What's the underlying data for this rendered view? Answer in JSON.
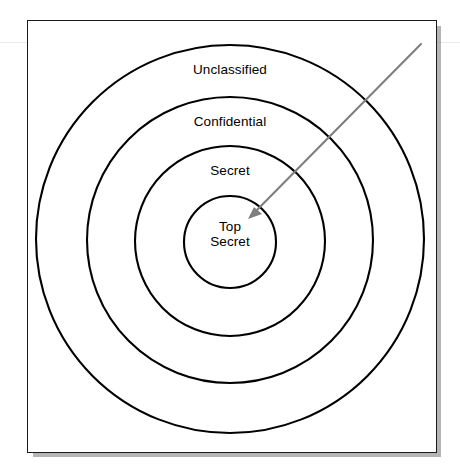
{
  "diagram": {
    "type": "concentric-rings",
    "background_color": "#ffffff",
    "frame": {
      "border_color": "#1a1a1a",
      "shadow_color": "#787878"
    },
    "rings": [
      {
        "index": 0,
        "label": "Unclassified",
        "level": 4,
        "stroke_color": "#000000",
        "fill_color": "#ffffff",
        "center": {
          "x": 230,
          "y": 239
        },
        "radius": 194
      },
      {
        "index": 1,
        "label": "Confidential",
        "level": 3,
        "stroke_color": "#000000",
        "fill_color": "#ffffff",
        "center": {
          "x": 230,
          "y": 240
        },
        "radius": 143
      },
      {
        "index": 2,
        "label": "Secret",
        "level": 2,
        "stroke_color": "#000000",
        "fill_color": "#ffffff",
        "center": {
          "x": 230,
          "y": 241
        },
        "radius": 95
      },
      {
        "index": 3,
        "label": "Top\nSecret",
        "label_line1": "Top",
        "label_line2": "Secret",
        "level": 1,
        "stroke_color": "#000000",
        "fill_color": "#ffffff",
        "center": {
          "x": 230,
          "y": 242
        },
        "radius": 46
      }
    ],
    "annotation_arrow": {
      "name": "pointer-arrow",
      "color": "#7f7f7f",
      "from": {
        "x": 421,
        "y": 44
      },
      "to": {
        "x": 249,
        "y": 218
      },
      "points_to": "Top Secret"
    }
  }
}
